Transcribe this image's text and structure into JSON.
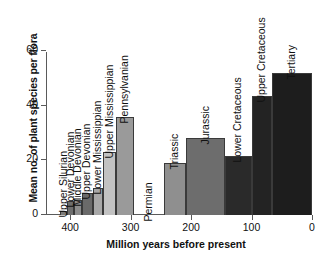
{
  "chart_data": {
    "type": "bar",
    "title": "",
    "xlabel": "Million years before present",
    "ylabel": "Mean no. of plant species per flora",
    "xlim": [
      440,
      0
    ],
    "ylim": [
      0,
      60
    ],
    "xticks": [
      400,
      300,
      200,
      100,
      0
    ],
    "xtick_labels": [
      "400",
      "300",
      "200",
      "100",
      "0"
    ],
    "yticks": [
      0,
      20,
      40,
      60
    ],
    "ytick_labels": [
      "0",
      "20",
      "40",
      "60"
    ],
    "grid": false,
    "legend": "none",
    "x_axis_direction": "reversed",
    "categories": [
      "Upper Silurian",
      "Lower Devonian",
      "Middle Devonian",
      "Upper Devonian",
      "Lower Mississippian",
      "Upper Mississippian",
      "Pennsylvanian",
      "Permian",
      "Triassic",
      "Jurassic",
      "Lower Cretaceous",
      "Upper Cretaceous",
      "Tertiary"
    ],
    "values": [
      1.5,
      5,
      5.5,
      8,
      10,
      23,
      36,
      null,
      19,
      28,
      21.5,
      43.5,
      52
    ],
    "bars": [
      {
        "label": "Upper Silurian",
        "value": 1.5,
        "x_start": 417,
        "x_end": 405,
        "color": "#7a7a7a"
      },
      {
        "label": "Lower Devonian",
        "value": 5,
        "x_start": 405,
        "x_end": 393,
        "color": "#6e6e6e"
      },
      {
        "label": "Middle Devonian",
        "value": 5.5,
        "x_start": 393,
        "x_end": 381,
        "color": "#8c8c8c"
      },
      {
        "label": "Upper Devonian",
        "value": 8,
        "x_start": 381,
        "x_end": 363,
        "color": "#6a6a6a"
      },
      {
        "label": "Lower Mississippian",
        "value": 10,
        "x_start": 363,
        "x_end": 345,
        "color": "#a8a8a8"
      },
      {
        "label": "Upper Mississippian",
        "value": 23,
        "x_start": 345,
        "x_end": 325,
        "color": "#c2c2c2"
      },
      {
        "label": "Pennsylvanian",
        "value": 36,
        "x_start": 325,
        "x_end": 295,
        "color": "#9a9a9a"
      },
      {
        "label": "Permian",
        "value": null,
        "x_start": 295,
        "x_end": 245,
        "color": "none"
      },
      {
        "label": "Triassic",
        "value": 19,
        "x_start": 245,
        "x_end": 208,
        "color": "#8f8f8f"
      },
      {
        "label": "Jurassic",
        "value": 28,
        "x_start": 208,
        "x_end": 144,
        "color": "#6d6d6d"
      },
      {
        "label": "Lower Cretaceous",
        "value": 21.5,
        "x_start": 144,
        "x_end": 100,
        "color": "#2a2a2a"
      },
      {
        "label": "Upper Cretaceous",
        "value": 43.5,
        "x_start": 100,
        "x_end": 66,
        "color": "#232323"
      },
      {
        "label": "Tertiary",
        "value": 52,
        "x_start": 66,
        "x_end": 0,
        "color": "#1d1d1d"
      }
    ]
  },
  "colors": {
    "axis": "#5a5a5a",
    "text": "#111111",
    "background": "#ffffff",
    "bar_outline": "#3a3a3a"
  }
}
